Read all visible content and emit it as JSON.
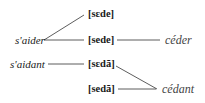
{
  "diagram": {
    "sources": [
      {
        "id": "s_aider",
        "text": "s'aider"
      },
      {
        "id": "s_aidant",
        "text": "s'aidant"
      }
    ],
    "pronunciations": [
      {
        "id": "p1",
        "text": "[sɛde]"
      },
      {
        "id": "p2",
        "text": "[sede]"
      },
      {
        "id": "p3",
        "text": "[sɛdã]"
      },
      {
        "id": "p4",
        "text": "[sedã]"
      }
    ],
    "targets": [
      {
        "id": "ceder",
        "text": "céder"
      },
      {
        "id": "cedant",
        "text": "cédant"
      }
    ],
    "edges": [
      [
        "s'aider",
        "[sɛde]"
      ],
      [
        "s'aider",
        "[sede]"
      ],
      [
        "[sede]",
        "céder"
      ],
      [
        "s'aidant",
        "[sɛdã]"
      ],
      [
        "[sɛdã]",
        "cédant"
      ],
      [
        "[sedã]",
        "cédant"
      ]
    ],
    "line_color": "#333333"
  }
}
